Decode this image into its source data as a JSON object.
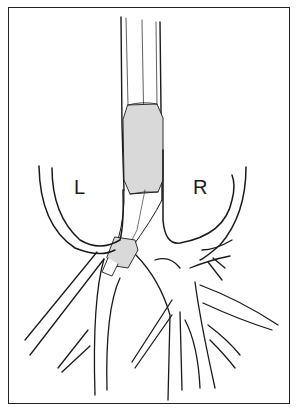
{
  "figure": {
    "type": "anatomical line drawing",
    "labels": {
      "left_lung": "L",
      "right_lung": "R"
    },
    "colors": {
      "line": "#1a1a1a",
      "cuff_fill": "#d9d9d9",
      "background": "#ffffff",
      "frame": "#222222"
    }
  }
}
